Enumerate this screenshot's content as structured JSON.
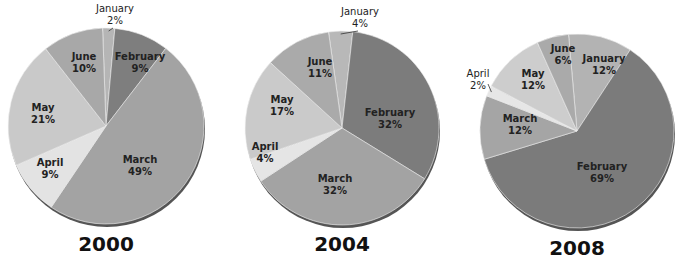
{
  "chart_data": [
    {
      "type": "pie",
      "title": "2000",
      "categories": [
        "January",
        "February",
        "March",
        "April",
        "May",
        "June"
      ],
      "values": [
        2,
        9,
        49,
        9,
        21,
        10
      ],
      "labels": [
        "January\n2%",
        "February\n9%",
        "March\n49%",
        "April\n9%",
        "May\n21%",
        "June\n10%"
      ]
    },
    {
      "type": "pie",
      "title": "2004",
      "categories": [
        "January",
        "February",
        "March",
        "April",
        "May",
        "June"
      ],
      "values": [
        4,
        32,
        32,
        4,
        17,
        11
      ],
      "labels": [
        "January\n4%",
        "February\n32%",
        "March\n32%",
        "April\n4%",
        "May\n17%",
        "June\n11%"
      ]
    },
    {
      "type": "pie",
      "title": "2008",
      "categories": [
        "January",
        "February",
        "March",
        "April",
        "May",
        "June"
      ],
      "values": [
        12,
        69,
        12,
        2,
        12,
        6
      ],
      "labels": [
        "January\n12%",
        "February\n69%",
        "March\n12%",
        "April\n2%",
        "May\n12%",
        "June\n6%"
      ]
    }
  ],
  "charts": [
    {
      "year": "2000",
      "cx": 106,
      "cy": 126,
      "r": 98,
      "start_deg": -2,
      "slices": [
        {
          "name": "January",
          "pct": "2%",
          "value": 2,
          "color": "#b5b5b5",
          "label_outside": true,
          "lx": 115,
          "ly": 12
        },
        {
          "name": "February",
          "pct": "9%",
          "value": 9,
          "color": "#7e7e7e",
          "lx": 140,
          "ly": 60
        },
        {
          "name": "March",
          "pct": "49%",
          "value": 49,
          "color": "#a3a3a3",
          "lx": 140,
          "ly": 163
        },
        {
          "name": "April",
          "pct": "9%",
          "value": 9,
          "color": "#e3e3e3",
          "lx": 50,
          "ly": 166
        },
        {
          "name": "May",
          "pct": "21%",
          "value": 21,
          "color": "#c9c9c9",
          "lx": 43,
          "ly": 111
        },
        {
          "name": "June",
          "pct": "10%",
          "value": 10,
          "color": "#a8a8a8",
          "lx": 84,
          "ly": 60
        }
      ]
    },
    {
      "year": "2004",
      "cx": 342,
      "cy": 128,
      "r": 97,
      "start_deg": -8,
      "slices": [
        {
          "name": "January",
          "pct": "4%",
          "value": 4,
          "color": "#b8b8b8",
          "label_outside": true,
          "lx": 360,
          "ly": 15
        },
        {
          "name": "February",
          "pct": "32%",
          "value": 32,
          "color": "#7c7c7c",
          "lx": 390,
          "ly": 116
        },
        {
          "name": "March",
          "pct": "32%",
          "value": 32,
          "color": "#a3a3a3",
          "lx": 335,
          "ly": 182
        },
        {
          "name": "April",
          "pct": "4%",
          "value": 4,
          "color": "#e5e5e5",
          "lx": 265,
          "ly": 150
        },
        {
          "name": "May",
          "pct": "17%",
          "value": 17,
          "color": "#cacaca",
          "lx": 282,
          "ly": 103
        },
        {
          "name": "June",
          "pct": "11%",
          "value": 11,
          "color": "#aaaaaa",
          "lx": 320,
          "ly": 65
        }
      ]
    },
    {
      "year": "2008",
      "cx": 577,
      "cy": 131,
      "r": 97,
      "start_deg": -5,
      "slices": [
        {
          "name": "January",
          "pct": "12%",
          "value": 12,
          "color": "#b3b3b3",
          "lx": 604,
          "ly": 62
        },
        {
          "name": "February",
          "pct": "69%",
          "value": 69,
          "color": "#7b7b7b",
          "lx": 602,
          "ly": 170
        },
        {
          "name": "March",
          "pct": "12%",
          "value": 12,
          "color": "#a5a5a5",
          "lx": 520,
          "ly": 122
        },
        {
          "name": "April",
          "pct": "2%",
          "value": 2,
          "color": "#e6e6e6",
          "label_outside": true,
          "lx": 478,
          "ly": 77
        },
        {
          "name": "May",
          "pct": "12%",
          "value": 12,
          "color": "#cdcdcd",
          "lx": 533,
          "ly": 77
        },
        {
          "name": "June",
          "pct": "6%",
          "value": 6,
          "color": "#aaaaaa",
          "lx": 563,
          "ly": 52
        }
      ]
    }
  ]
}
